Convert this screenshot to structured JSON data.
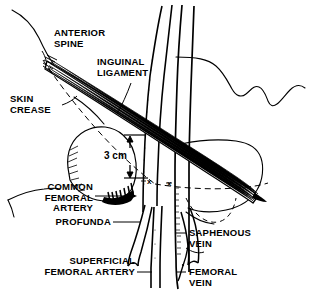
{
  "figure": {
    "background_color": "#ffffff",
    "ink_color": "#000000"
  },
  "labels": {
    "anterior_spine": "ANTERIOR\nSPINE",
    "skin_crease": "SKIN\nCREASE",
    "inguinal_ligament": "INGUINAL\nLIGAMENT",
    "common_femoral_artery": "COMMON\nFEMORAL\nARTERY",
    "profunda": "PROFUNDA",
    "superficial_femoral_artery": "SUPERFICIAL\nFEMORAL ARTERY",
    "saphenous_vein": "SAPHENOUS\nVEIN",
    "femoral_vein": "FEMORAL\nVEIN"
  },
  "measurement": {
    "distance": "3 cm"
  },
  "puncture_marks": {
    "artery_mark": "x",
    "vein_mark": "x"
  }
}
